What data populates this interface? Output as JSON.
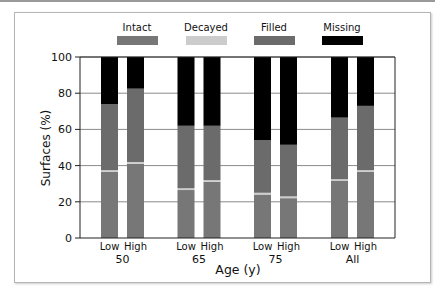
{
  "chart_data": {
    "type": "bar",
    "stacked": true,
    "title": "",
    "xlabel": "Age (y)",
    "ylabel": "Surfaces (%)",
    "ylim": [
      0,
      100
    ],
    "yticks": [
      0,
      20,
      40,
      60,
      80,
      100
    ],
    "grid": true,
    "legend_position": "top",
    "groups": [
      "50",
      "65",
      "75",
      "All"
    ],
    "subcategories": [
      "Low",
      "High"
    ],
    "categories": [
      "Low 50",
      "High 50",
      "Low 65",
      "High 65",
      "Low 75",
      "High 75",
      "Low All",
      "High All"
    ],
    "series": [
      {
        "name": "Intact",
        "color": "#777777",
        "values": [
          36.5,
          41,
          26.5,
          31,
          24,
          22,
          31.5,
          36.5
        ]
      },
      {
        "name": "Decayed",
        "color": "#cccccc",
        "values": [
          1,
          1,
          1,
          1,
          1,
          1,
          1,
          1
        ]
      },
      {
        "name": "Filled",
        "color": "#6b6b6b",
        "values": [
          36.5,
          40.5,
          34.5,
          30,
          29,
          28.5,
          34,
          35.5
        ]
      },
      {
        "name": "Missing",
        "color": "#000000",
        "values": [
          26,
          17.5,
          38,
          38,
          46,
          48.5,
          33.5,
          27
        ]
      }
    ]
  }
}
